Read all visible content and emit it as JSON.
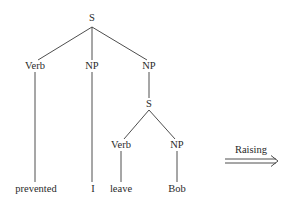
{
  "diagram": {
    "type": "syntax-tree",
    "nodes": {
      "root_s": "S",
      "verb": "Verb",
      "np1": "NP",
      "np2": "NP",
      "embedded_s": "S",
      "embedded_verb": "Verb",
      "embedded_np": "NP"
    },
    "leaves": {
      "prevented": "prevented",
      "i": "I",
      "leave": "leave",
      "bob": "Bob"
    },
    "transformation": {
      "label": "Raising",
      "arrow": "double-arrow-right"
    },
    "colors": {
      "line": "#3a3a3a",
      "text": "#2a2a2a",
      "background": "#ffffff"
    }
  }
}
